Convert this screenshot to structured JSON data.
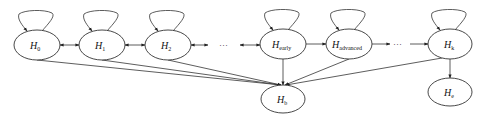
{
  "diagram": {
    "type": "state-transition-graph",
    "nodes": [
      {
        "id": "H0",
        "base": "H",
        "sub": "0",
        "cx": 37,
        "cy": 45,
        "rx": 23,
        "ry": 15,
        "self_loop": true
      },
      {
        "id": "H1",
        "base": "H",
        "sub": "1",
        "cx": 102,
        "cy": 45,
        "rx": 23,
        "ry": 15,
        "self_loop": true
      },
      {
        "id": "H2",
        "base": "H",
        "sub": "2",
        "cx": 168,
        "cy": 45,
        "rx": 23,
        "ry": 15,
        "self_loop": true
      },
      {
        "id": "Hearly",
        "base": "H",
        "sub": "early",
        "cx": 283,
        "cy": 44,
        "rx": 23,
        "ry": 15,
        "self_loop": true
      },
      {
        "id": "Hadvanced",
        "base": "H",
        "sub": "advanced",
        "cx": 349,
        "cy": 44,
        "rx": 23,
        "ry": 15,
        "self_loop": true
      },
      {
        "id": "Hk",
        "base": "H",
        "sub": "k",
        "cx": 450,
        "cy": 44,
        "rx": 22,
        "ry": 15,
        "self_loop": true
      },
      {
        "id": "Hb",
        "base": "H",
        "sub": "b",
        "cx": 283,
        "cy": 99,
        "rx": 22,
        "ry": 14,
        "self_loop": false
      },
      {
        "id": "He",
        "base": "H",
        "sub": "e",
        "cx": 450,
        "cy": 92,
        "rx": 22,
        "ry": 14,
        "self_loop": false
      }
    ],
    "ellipsis_labels": [
      {
        "text": "···",
        "x": 225,
        "y": 47
      },
      {
        "text": "···",
        "x": 397,
        "y": 46
      }
    ],
    "edges": [
      {
        "from": "H0",
        "to": "H1",
        "style": "bidirectional"
      },
      {
        "from": "H1",
        "to": "H2",
        "style": "bidirectional"
      },
      {
        "from": "H2",
        "to": "dots1",
        "style": "bidirectional"
      },
      {
        "from": "dots1",
        "to": "Hearly",
        "style": "bidirectional"
      },
      {
        "from": "Hearly",
        "to": "Hadvanced",
        "style": "directed"
      },
      {
        "from": "Hadvanced",
        "to": "dots2",
        "style": "directed"
      },
      {
        "from": "dots2",
        "to": "Hk",
        "style": "directed"
      },
      {
        "from": "H0",
        "to": "Hb",
        "style": "directed"
      },
      {
        "from": "H1",
        "to": "Hb",
        "style": "directed"
      },
      {
        "from": "H2",
        "to": "Hb",
        "style": "directed"
      },
      {
        "from": "Hearly",
        "to": "Hb",
        "style": "directed"
      },
      {
        "from": "Hadvanced",
        "to": "Hb",
        "style": "directed"
      },
      {
        "from": "Hk",
        "to": "Hb",
        "style": "directed"
      },
      {
        "from": "Hk",
        "to": "He",
        "style": "directed"
      }
    ]
  },
  "labels": {
    "h0": {
      "base": "H",
      "sub": "0"
    },
    "h1": {
      "base": "H",
      "sub": "1"
    },
    "h2": {
      "base": "H",
      "sub": "2"
    },
    "hearly": {
      "base": "H",
      "sub": "early"
    },
    "hadvanced": {
      "base": "H",
      "sub": "advanced"
    },
    "hk": {
      "base": "H",
      "sub": "k"
    },
    "hb": {
      "base": "H",
      "sub": "b"
    },
    "he": {
      "base": "H",
      "sub": "e"
    },
    "dots1": "···",
    "dots2": "···"
  }
}
